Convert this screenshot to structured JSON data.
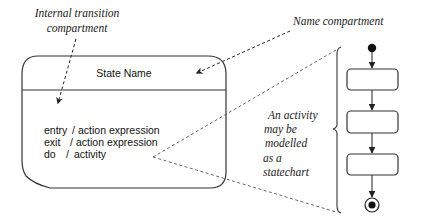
{
  "diagram": {
    "type": "UML state diagram explanation",
    "labels": {
      "internal_transition_line1": "Internal transition",
      "internal_transition_line2": "compartment",
      "name_compartment": "Name compartment",
      "activity_note_lines": [
        "An activity",
        "may be",
        "modelled",
        "as a",
        "statechart"
      ]
    },
    "state": {
      "name": "State Name",
      "internal_transitions": [
        {
          "event": "entry",
          "separator": "/",
          "action": "action expression"
        },
        {
          "event": "exit",
          "separator": "/",
          "action": "action expression"
        },
        {
          "event": "do",
          "separator": "/",
          "action": "activity"
        }
      ]
    },
    "activity_statechart": {
      "initial_state": "filled-circle",
      "states": [
        "",
        "",
        ""
      ],
      "final_state": "bullseye"
    },
    "colors": {
      "stroke": "#333333",
      "background": "#ffffff"
    }
  }
}
